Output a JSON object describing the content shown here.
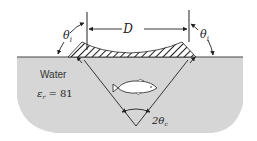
{
  "diagram": {
    "labels": {
      "width": "D",
      "angle_left": "θ",
      "angle_left_sub": "i",
      "angle_right": "θ",
      "angle_right_sub": "i",
      "medium": "Water",
      "permittivity_symbol": "ε",
      "permittivity_sub": "r",
      "permittivity_value": " = 81",
      "cone_angle": "2θ",
      "cone_angle_sub": "c"
    },
    "colors": {
      "water": "#d6d6d6",
      "lines": "#222222",
      "background": "#ffffff",
      "fish": "#ffffff"
    }
  }
}
